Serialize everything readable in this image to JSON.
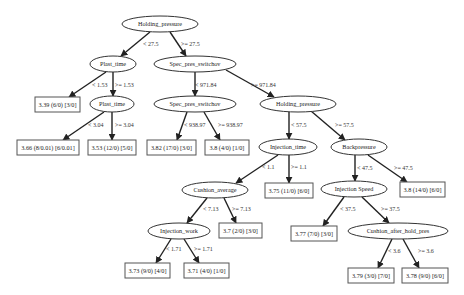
{
  "diagram": {
    "type": "decision-tree",
    "nodes": [
      {
        "id": "n0",
        "kind": "split",
        "label": "Holding_pressure",
        "cx": 160,
        "cy": 24,
        "rx": 38,
        "ry": 8
      },
      {
        "id": "n1",
        "kind": "split",
        "label": "Plast_time",
        "cx": 113,
        "cy": 64,
        "rx": 23,
        "ry": 8
      },
      {
        "id": "n2",
        "kind": "split",
        "label": "Spec_pres_switchov",
        "cx": 195,
        "cy": 64,
        "rx": 41,
        "ry": 8
      },
      {
        "id": "n3",
        "kind": "leaf",
        "label": "3.39 (6/0) [3/0]",
        "x": 35,
        "y": 97,
        "w": 45,
        "h": 15
      },
      {
        "id": "n4",
        "kind": "split",
        "label": "Plast_time",
        "cx": 112,
        "cy": 104,
        "rx": 22,
        "ry": 8
      },
      {
        "id": "n5",
        "kind": "split",
        "label": "Spec_pres_switchov",
        "cx": 195,
        "cy": 104,
        "rx": 41,
        "ry": 8
      },
      {
        "id": "n6",
        "kind": "split",
        "label": "Holding_pressure",
        "cx": 298,
        "cy": 104,
        "rx": 38,
        "ry": 8
      },
      {
        "id": "n7",
        "kind": "leaf",
        "label": "3.66 (8/0.01) [6/0.01]",
        "x": 17,
        "y": 140,
        "w": 62,
        "h": 15
      },
      {
        "id": "n8",
        "kind": "leaf",
        "label": "3.53 (12/0) [5/0]",
        "x": 88,
        "y": 140,
        "w": 48,
        "h": 15
      },
      {
        "id": "n9",
        "kind": "leaf",
        "label": "3.82 (17/0) [3/0]",
        "x": 147,
        "y": 140,
        "w": 49,
        "h": 15
      },
      {
        "id": "n10",
        "kind": "leaf",
        "label": "3.8 (4/0) [1/0]",
        "x": 205,
        "y": 140,
        "w": 44,
        "h": 15
      },
      {
        "id": "n11",
        "kind": "split",
        "label": "Injection_time",
        "cx": 288,
        "cy": 147,
        "rx": 29,
        "ry": 8
      },
      {
        "id": "n12",
        "kind": "split",
        "label": "Backpressure",
        "cx": 359,
        "cy": 147,
        "rx": 28,
        "ry": 8
      },
      {
        "id": "n13",
        "kind": "split",
        "label": "Cushion_average",
        "cx": 215,
        "cy": 190,
        "rx": 33,
        "ry": 8
      },
      {
        "id": "n14",
        "kind": "leaf",
        "label": "3.75 (11/0) [6/0]",
        "x": 265,
        "y": 183,
        "w": 48,
        "h": 15
      },
      {
        "id": "n15",
        "kind": "split",
        "label": "Injection Speed",
        "cx": 354,
        "cy": 189,
        "rx": 33,
        "ry": 8
      },
      {
        "id": "n16",
        "kind": "leaf",
        "label": "3.8 (14/0) [6/0]",
        "x": 400,
        "y": 182,
        "w": 45,
        "h": 15
      },
      {
        "id": "n17",
        "kind": "split",
        "label": "Injection_work",
        "cx": 179,
        "cy": 231,
        "rx": 31,
        "ry": 8
      },
      {
        "id": "n18",
        "kind": "leaf",
        "label": "3.7 (2/0) [3/0]",
        "x": 219,
        "y": 223,
        "w": 43,
        "h": 15
      },
      {
        "id": "n19",
        "kind": "leaf",
        "label": "3.77 (7/0) [3/0]",
        "x": 291,
        "y": 226,
        "w": 46,
        "h": 15
      },
      {
        "id": "n20",
        "kind": "split",
        "label": "Cushion_after_hold_pres",
        "cx": 398,
        "cy": 231,
        "rx": 50,
        "ry": 8
      },
      {
        "id": "n21",
        "kind": "leaf",
        "label": "3.73 (9/0) [4/0]",
        "x": 125,
        "y": 263,
        "w": 45,
        "h": 15
      },
      {
        "id": "n22",
        "kind": "leaf",
        "label": "3.71 (4/0) [1/0]",
        "x": 184,
        "y": 263,
        "w": 45,
        "h": 15
      },
      {
        "id": "n23",
        "kind": "leaf",
        "label": "3.79 (3/0) [7/0]",
        "x": 348,
        "y": 268,
        "w": 46,
        "h": 15
      },
      {
        "id": "n24",
        "kind": "leaf",
        "label": "3.78 (9/0) [6/0]",
        "x": 402,
        "y": 268,
        "w": 46,
        "h": 15
      }
    ],
    "edges": [
      {
        "from": "n0",
        "to": "n1",
        "label": "< 27.5",
        "x1": 150,
        "y1": 32,
        "x2": 121,
        "y2": 56,
        "lx": 143,
        "ly": 46
      },
      {
        "from": "n0",
        "to": "n2",
        "label": ">= 27.5",
        "x1": 170,
        "y1": 32,
        "x2": 186,
        "y2": 56,
        "lx": 181,
        "ly": 46
      },
      {
        "from": "n1",
        "to": "n3",
        "label": "< 1.53",
        "x1": 106,
        "y1": 72,
        "x2": 69,
        "y2": 97,
        "lx": 92,
        "ly": 87
      },
      {
        "from": "n1",
        "to": "n4",
        "label": ">= 1.53",
        "x1": 113,
        "y1": 72,
        "x2": 113,
        "y2": 96,
        "lx": 115,
        "ly": 87
      },
      {
        "from": "n2",
        "to": "n5",
        "label": "< 971.84",
        "x1": 195,
        "y1": 72,
        "x2": 195,
        "y2": 96,
        "lx": 195,
        "ly": 87
      },
      {
        "from": "n2",
        "to": "n6",
        "label": ">= 971.84",
        "x1": 226,
        "y1": 70,
        "x2": 274,
        "y2": 97,
        "lx": 251,
        "ly": 87
      },
      {
        "from": "n4",
        "to": "n7",
        "label": "< 3.04",
        "x1": 104,
        "y1": 112,
        "x2": 63,
        "y2": 140,
        "lx": 88,
        "ly": 127
      },
      {
        "from": "n4",
        "to": "n8",
        "label": ">= 3.04",
        "x1": 112,
        "y1": 112,
        "x2": 112,
        "y2": 140,
        "lx": 115,
        "ly": 127
      },
      {
        "from": "n5",
        "to": "n9",
        "label": "< 938.97",
        "x1": 187,
        "y1": 112,
        "x2": 177,
        "y2": 140,
        "lx": 184,
        "ly": 127
      },
      {
        "from": "n5",
        "to": "n10",
        "label": ">= 938.97",
        "x1": 204,
        "y1": 112,
        "x2": 220,
        "y2": 140,
        "lx": 218,
        "ly": 127
      },
      {
        "from": "n6",
        "to": "n11",
        "label": "< 57.5",
        "x1": 289,
        "y1": 112,
        "x2": 289,
        "y2": 139,
        "lx": 291,
        "ly": 127
      },
      {
        "from": "n6",
        "to": "n12",
        "label": ">= 57.5",
        "x1": 311,
        "y1": 111,
        "x2": 345,
        "y2": 140,
        "lx": 335,
        "ly": 127
      },
      {
        "from": "n11",
        "to": "n13",
        "label": "< 1.1",
        "x1": 278,
        "y1": 155,
        "x2": 236,
        "y2": 183,
        "lx": 262,
        "ly": 169
      },
      {
        "from": "n11",
        "to": "n14",
        "label": ">= 1.1",
        "x1": 289,
        "y1": 155,
        "x2": 289,
        "y2": 183,
        "lx": 291,
        "ly": 169
      },
      {
        "from": "n12",
        "to": "n15",
        "label": "< 47.5",
        "x1": 355,
        "y1": 155,
        "x2": 355,
        "y2": 181,
        "lx": 357,
        "ly": 170
      },
      {
        "from": "n12",
        "to": "n16",
        "label": ">= 47.5",
        "x1": 368,
        "y1": 155,
        "x2": 407,
        "y2": 182,
        "lx": 394,
        "ly": 170
      },
      {
        "from": "n13",
        "to": "n17",
        "label": "< 7.13",
        "x1": 207,
        "y1": 198,
        "x2": 187,
        "y2": 223,
        "lx": 203,
        "ly": 211
      },
      {
        "from": "n13",
        "to": "n18",
        "label": ">= 7.13",
        "x1": 224,
        "y1": 198,
        "x2": 236,
        "y2": 223,
        "lx": 232,
        "ly": 211
      },
      {
        "from": "n15",
        "to": "n19",
        "label": "< 37.5",
        "x1": 344,
        "y1": 197,
        "x2": 323,
        "y2": 226,
        "lx": 340,
        "ly": 211
      },
      {
        "from": "n15",
        "to": "n20",
        "label": ">= 37.5",
        "x1": 362,
        "y1": 197,
        "x2": 389,
        "y2": 223,
        "lx": 381,
        "ly": 211
      },
      {
        "from": "n17",
        "to": "n21",
        "label": "< 1.71",
        "x1": 171,
        "y1": 239,
        "x2": 156,
        "y2": 263,
        "lx": 166,
        "ly": 251
      },
      {
        "from": "n17",
        "to": "n22",
        "label": ">= 1.71",
        "x1": 184,
        "y1": 239,
        "x2": 199,
        "y2": 263,
        "lx": 194,
        "ly": 251
      },
      {
        "from": "n20",
        "to": "n23",
        "label": "< 3.6",
        "x1": 392,
        "y1": 239,
        "x2": 378,
        "y2": 268,
        "lx": 388,
        "ly": 253
      },
      {
        "from": "n20",
        "to": "n24",
        "label": ">= 3.6",
        "x1": 403,
        "y1": 239,
        "x2": 419,
        "y2": 268,
        "lx": 418,
        "ly": 253
      }
    ]
  }
}
